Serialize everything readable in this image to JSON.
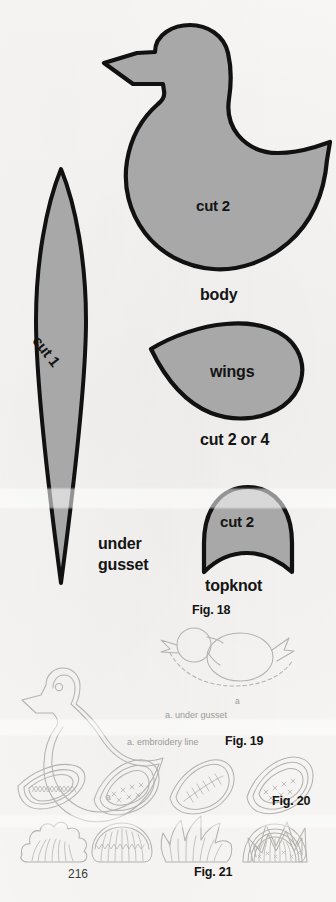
{
  "page": {
    "number": "216",
    "background_color": "#f5f4f2",
    "pattern_fill_color": "#a8a8a8",
    "pattern_outline_color": "#111111",
    "diagram_line_color": "#b4b2ae",
    "label_color": "#141414",
    "caption_color": "#9a9a98"
  },
  "pattern_pieces": [
    {
      "id": "body",
      "name": "body",
      "cut_label": "cut 2",
      "part_label": "body",
      "shape": "bird-silhouette-with-crescent-tail"
    },
    {
      "id": "under-gusset",
      "name": "under gusset",
      "cut_label": "cut 1",
      "part_label_line1": "under",
      "part_label_line2": "gusset",
      "shape": "pointed-lens"
    },
    {
      "id": "wings",
      "name": "wings",
      "cut_label": "wings",
      "part_label": "cut 2 or 4",
      "shape": "teardrop-paisley"
    },
    {
      "id": "topknot",
      "name": "topknot",
      "cut_label": "cut 2",
      "part_label": "topknot",
      "shape": "dome-with-concave-base"
    }
  ],
  "figures": [
    {
      "id": "fig18",
      "label": "Fig. 18",
      "caption": "a. under gusset",
      "marker": "a",
      "description": "circle head and oval body construction with dashed under-gusset line"
    },
    {
      "id": "fig19",
      "label": "Fig. 19",
      "caption": "a. embroidery line",
      "marker": "a",
      "description": "bird outline with eye and inner embroidery line"
    },
    {
      "id": "fig20",
      "label": "Fig. 20",
      "description": "four paisley wing embroidery motif variations"
    },
    {
      "id": "fig21",
      "label": "Fig. 21",
      "description": "five topknot crest design variations"
    }
  ],
  "labels": {
    "body_cut": "cut 2",
    "body_name": "body",
    "gusset_cut": "cut 1",
    "gusset_name_line1": "under",
    "gusset_name_line2": "gusset",
    "wings_name": "wings",
    "wings_cut": "cut 2 or 4",
    "topknot_cut": "cut 2",
    "topknot_name": "topknot",
    "fig18": "Fig. 18",
    "fig19": "Fig. 19",
    "fig20": "Fig. 20",
    "fig21": "Fig. 21",
    "caption_under_gusset": "a. under gusset",
    "caption_embroidery_line": "a. embroidery line",
    "marker_a": "a",
    "page_number": "216"
  }
}
